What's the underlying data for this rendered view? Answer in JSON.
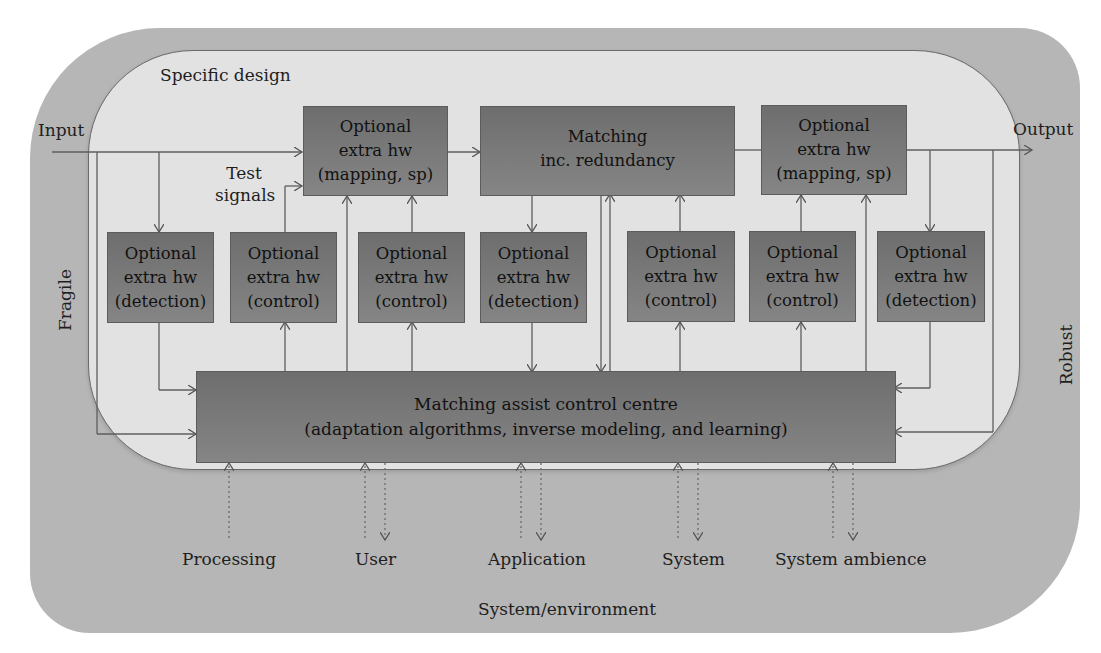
{
  "diagram": {
    "outer_label": "System/environment",
    "inner_label": "Specific design",
    "input_label": "Input",
    "output_label": "Output",
    "test_signals_label": "Test signals",
    "left_side_label": "Fragile",
    "right_side_label": "Robust",
    "top_boxes": [
      {
        "line1": "Optional",
        "line2": "extra hw",
        "line3": "(mapping, sp)"
      },
      {
        "line1": "Matching",
        "line2": "inc. redundancy"
      },
      {
        "line1": "Optional",
        "line2": "extra hw",
        "line3": "(mapping, sp)"
      }
    ],
    "middle_boxes": [
      {
        "line1": "Optional",
        "line2": "extra hw",
        "line3": "(detection)"
      },
      {
        "line1": "Optional",
        "line2": "extra hw",
        "line3": "(control)"
      },
      {
        "line1": "Optional",
        "line2": "extra hw",
        "line3": "(control)"
      },
      {
        "line1": "Optional",
        "line2": "extra hw",
        "line3": "(detection)"
      },
      {
        "line1": "Optional",
        "line2": "extra hw",
        "line3": "(control)"
      },
      {
        "line1": "Optional",
        "line2": "extra hw",
        "line3": "(control)"
      },
      {
        "line1": "Optional",
        "line2": "extra hw",
        "line3": "(detection)"
      }
    ],
    "control_centre": {
      "line1": "Matching assist control centre",
      "line2": "(adaptation algorithms, inverse modeling, and learning)"
    },
    "external_inputs": [
      "Processing",
      "User",
      "Application",
      "System",
      "System ambience"
    ],
    "colors": {
      "outer_fill": "#b6b6b6",
      "inner_fill": "#e2e2e2",
      "box_fill": "#7a7a7a",
      "line": "#5a5a5a"
    }
  }
}
